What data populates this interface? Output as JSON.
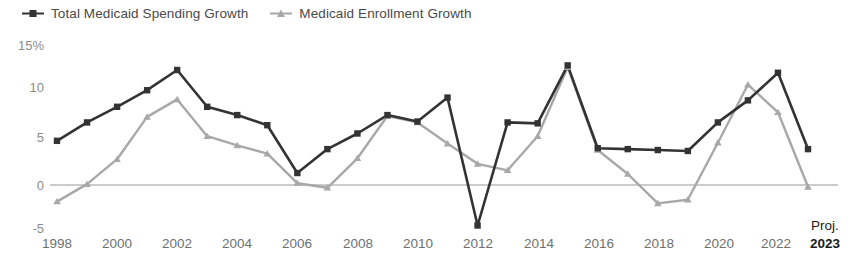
{
  "legend": {
    "position": "top-left",
    "items": [
      {
        "label": "Total Medicaid Spending Growth",
        "color": "#333333",
        "marker": "square",
        "name": "legend-spending"
      },
      {
        "label": "Medicaid Enrollment Growth",
        "color": "#a8a8a8",
        "marker": "triangle",
        "name": "legend-enrollment"
      }
    ]
  },
  "axis": {
    "y_ticks": [
      "15%",
      "10",
      "5",
      "0",
      "-5"
    ],
    "y_tick_values": [
      15,
      10,
      5,
      0,
      -5
    ],
    "x_ticks": [
      "1998",
      "2000",
      "2002",
      "2004",
      "2006",
      "2008",
      "2010",
      "2012",
      "2014",
      "2016",
      "2018",
      "2020",
      "2022",
      "2023"
    ],
    "proj_note": "Proj.",
    "proj_year": "2023"
  },
  "chart_data": {
    "type": "line",
    "title": "",
    "subtitle": "",
    "xlabel": "",
    "ylabel": "",
    "ylim": [
      -5,
      15
    ],
    "grid": false,
    "zero_line": true,
    "legend_position": "top-left",
    "x": [
      1998,
      1999,
      2000,
      2001,
      2002,
      2003,
      2004,
      2005,
      2006,
      2007,
      2008,
      2009,
      2010,
      2011,
      2012,
      2013,
      2014,
      2015,
      2016,
      2017,
      2018,
      2019,
      2020,
      2021,
      2022,
      2023
    ],
    "series": [
      {
        "name": "Total Medicaid Spending Growth",
        "color": "#333333",
        "marker": "square",
        "values": [
          4.8,
          6.8,
          8.5,
          10.3,
          12.5,
          8.5,
          7.6,
          6.5,
          1.3,
          3.9,
          5.6,
          7.6,
          6.9,
          9.5,
          -4.4,
          6.8,
          6.7,
          13.0,
          4.0,
          3.9,
          3.8,
          3.7,
          6.8,
          9.2,
          12.2,
          3.9
        ]
      },
      {
        "name": "Medicaid Enrollment Growth",
        "color": "#a8a8a8",
        "marker": "triangle",
        "values": [
          -1.8,
          0.1,
          2.8,
          7.4,
          9.3,
          5.3,
          4.3,
          3.4,
          0.2,
          -0.3,
          2.9,
          7.5,
          6.8,
          4.5,
          2.3,
          1.6,
          5.3,
          12.8,
          3.8,
          1.2,
          -2.0,
          -1.6,
          4.6,
          10.9,
          7.9,
          -0.2
        ]
      }
    ]
  }
}
